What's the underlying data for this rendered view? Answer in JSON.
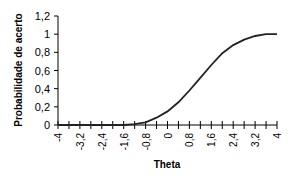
{
  "chart_data": {
    "type": "line",
    "title": "",
    "xlabel": "Theta",
    "ylabel": "Probabilidade de acerto",
    "xlim": [
      -4,
      4
    ],
    "ylim": [
      0,
      1.2
    ],
    "x_ticks": [
      "-4",
      "-3,2",
      "-2,4",
      "-1,6",
      "-0,8",
      "0",
      "0,8",
      "1,6",
      "2,4",
      "3,2",
      "4"
    ],
    "y_ticks": [
      "0",
      "0,2",
      "0,4",
      "0,6",
      "0,8",
      "1",
      "1,2"
    ],
    "grid": false,
    "legend": null,
    "series": [
      {
        "name": "Curva característica do item",
        "x": [
          -4,
          -3.6,
          -3.2,
          -2.8,
          -2.4,
          -2,
          -1.6,
          -1.2,
          -0.8,
          -0.4,
          0,
          0.4,
          0.8,
          1.2,
          1.6,
          2,
          2.4,
          2.8,
          3.2,
          3.6,
          4
        ],
        "y": [
          0,
          0,
          0,
          0,
          0,
          0,
          0,
          0.01,
          0.03,
          0.08,
          0.15,
          0.25,
          0.38,
          0.52,
          0.66,
          0.79,
          0.88,
          0.94,
          0.98,
          1.0,
          1.0
        ]
      }
    ]
  }
}
